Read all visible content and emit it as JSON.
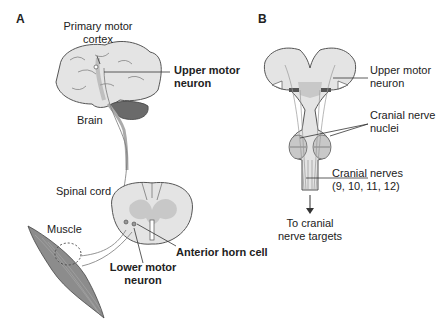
{
  "panels": {
    "a": {
      "letter": "A",
      "labels": {
        "primary_motor_cortex_1": "Primary motor",
        "primary_motor_cortex_2": "cortex",
        "upper_motor_neuron_1": "Upper motor",
        "upper_motor_neuron_2": "neuron",
        "brain": "Brain",
        "spinal_cord": "Spinal cord",
        "muscle": "Muscle",
        "lower_motor_neuron_1": "Lower motor",
        "lower_motor_neuron_2": "neuron",
        "anterior_horn_cell": "Anterior horn cell"
      }
    },
    "b": {
      "letter": "B",
      "labels": {
        "upper_motor_neuron_1": "Upper motor",
        "upper_motor_neuron_2": "neuron",
        "cranial_nerve_nuclei_1": "Cranial nerve",
        "cranial_nerve_nuclei_2": "nuclei",
        "cranial_nerves_1": "Cranial nerves",
        "cranial_nerves_2": "(9, 10, 11, 12)",
        "targets_1": "To cranial",
        "targets_2": "nerve targets"
      }
    }
  },
  "colors": {
    "tissue": "#e4e4e4",
    "outline": "#555555",
    "grey_matter": "#c8c8c8",
    "cerebellum": "#6a6a6a",
    "muscle": "#8c8c8c"
  }
}
